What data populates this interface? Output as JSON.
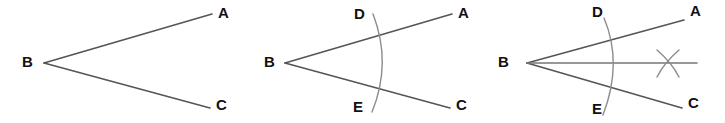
{
  "figure": {
    "background_color": "#ffffff",
    "line_color": "#555555",
    "arc_color": "#8c8c8c",
    "label_color": "#111111",
    "panels": [
      {
        "name": "panel-1-angle",
        "caption": "Angle ABC",
        "labels": {
          "vertex": "B",
          "ray_upper": "A",
          "ray_lower": "C"
        }
      },
      {
        "name": "panel-2-arc",
        "caption": "Arc from B crossing both rays at D and E",
        "labels": {
          "vertex": "B",
          "ray_upper": "A",
          "ray_lower": "C",
          "arc_upper": "D",
          "arc_lower": "E"
        }
      },
      {
        "name": "panel-3-bisector",
        "caption": "Bisector ray from B through arc intersection X",
        "labels": {
          "vertex": "B",
          "ray_upper": "A",
          "ray_lower": "C",
          "arc_upper": "D",
          "arc_lower": "E"
        }
      }
    ]
  }
}
